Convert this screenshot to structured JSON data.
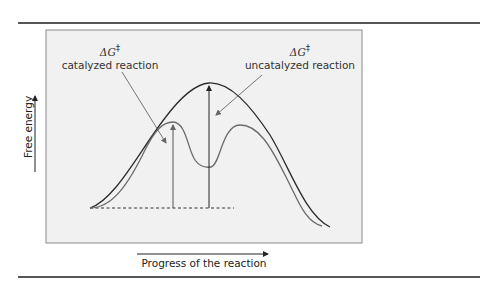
{
  "figure": {
    "type": "energy-profile-diagram",
    "labels": {
      "catalyzed": {
        "symbol": "ΔG",
        "superscript": "‡",
        "text": "catalyzed reaction"
      },
      "uncatalyzed": {
        "symbol": "ΔG",
        "superscript": "‡",
        "text": "uncatalyzed reaction"
      }
    },
    "axes": {
      "x_label": "Progress of the reaction",
      "y_label": "Free energy"
    },
    "curves": [
      {
        "name": "uncatalyzed",
        "color": "#2b2b2b",
        "peaks": 1
      },
      {
        "name": "catalyzed",
        "color": "#6a6a6a",
        "peaks": 2,
        "has_intermediate": true
      }
    ],
    "colors": {
      "panel_bg": "#f1f1f1",
      "panel_border": "#8a8a8a",
      "rule": "#555555"
    }
  }
}
